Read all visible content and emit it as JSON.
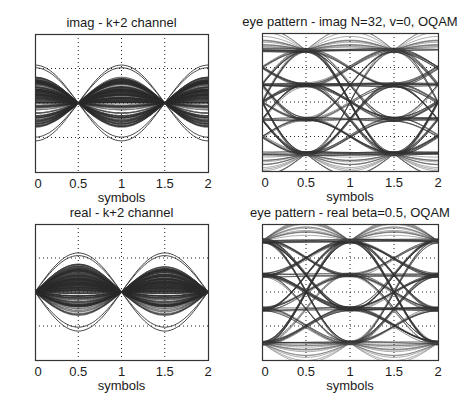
{
  "chart_data": [
    {
      "id": "tl",
      "type": "line",
      "title": "imag - k+2 channel",
      "xlabel": "symbols",
      "ylabel": "",
      "xlim": [
        0,
        2
      ],
      "ylim": [
        -4,
        4
      ],
      "xticks": [
        "0",
        "0.5",
        "1",
        "1.5",
        "2"
      ],
      "yticks": [
        "4",
        "2",
        "0",
        "- 2",
        "- 4"
      ],
      "grid": true,
      "description": "Crosstalk traces: lobes between nulls at 0.5 and 1.5 symbols; peak envelope about ±1.5 dense, outliers to ±2.2",
      "nulls_at": [
        0.5,
        1.5
      ],
      "envelope_peak": 1.5,
      "outlier_peak": 2.2,
      "box": {
        "x": 35,
        "y": 34,
        "w": 173,
        "h": 138
      }
    },
    {
      "id": "tr",
      "type": "line",
      "title": "eye pattern - imag N=32, v=0, OQAM",
      "xlabel": "symbols",
      "ylabel": "",
      "xlim": [
        0,
        2
      ],
      "ylim": [
        -4,
        4
      ],
      "xticks": [
        "0",
        "0.5",
        "1",
        "1.5",
        "2"
      ],
      "yticks": [
        "4",
        "2",
        "0",
        "- 2",
        "- 4"
      ],
      "grid": true,
      "description": "4-level eye diagram, eye openings centered at 0.5 and 1.5 symbols, levels ±1, ±3",
      "levels": [
        -3,
        -1,
        1,
        3
      ],
      "eye_centers": [
        0.5,
        1.5
      ],
      "box": {
        "x": 262,
        "y": 33,
        "w": 176,
        "h": 138
      }
    },
    {
      "id": "bl",
      "type": "line",
      "title": "real -  k+2 channel",
      "xlabel": "symbols",
      "ylabel": "",
      "xlim": [
        0,
        2
      ],
      "ylim": [
        -4,
        4
      ],
      "xticks": [
        "0",
        "0.5",
        "1",
        "1.5",
        "2"
      ],
      "yticks": [
        "4",
        "2",
        "0",
        "- 2",
        "- 4"
      ],
      "grid": true,
      "description": "Crosstalk traces: nulls at 0, 1, 2 symbols; lobes peak near ±1.6 at 0.5 and to ±2.2 at 1.5",
      "nulls_at": [
        0,
        1,
        2
      ],
      "envelope_peak": 1.5,
      "outlier_peak": 2.3,
      "box": {
        "x": 35,
        "y": 224,
        "w": 173,
        "h": 136
      }
    },
    {
      "id": "br",
      "type": "line",
      "title": "eye pattern - real  beta=0.5, OQAM",
      "xlabel": "symbols",
      "ylabel": "",
      "xlim": [
        0,
        2
      ],
      "ylim": [
        -4,
        4
      ],
      "xticks": [
        "0",
        "0.5",
        "1",
        "1.5",
        "2"
      ],
      "yticks": [
        "4",
        "2",
        "0",
        "- 2",
        "- 4"
      ],
      "grid": true,
      "description": "4-level eye diagram, eye openings centered at 0, 1 and 2 symbols, levels ±1, ±3",
      "levels": [
        -3,
        -1,
        1,
        3
      ],
      "eye_centers": [
        0,
        1,
        2
      ],
      "box": {
        "x": 262,
        "y": 224,
        "w": 176,
        "h": 136
      }
    }
  ]
}
